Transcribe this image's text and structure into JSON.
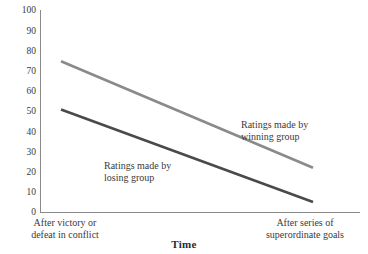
{
  "chart_data": {
    "type": "line",
    "title": "",
    "xlabel": "Time",
    "ylabel": "",
    "ylim": [
      0,
      100
    ],
    "grid": false,
    "legend_position": "inline-annotation",
    "categories": [
      "After victory or defeat in conflict",
      "After series of superordinate goals"
    ],
    "x": [
      0,
      1
    ],
    "yticks": [
      "0",
      "10",
      "20",
      "30",
      "40",
      "50",
      "60",
      "70",
      "80",
      "90",
      "100"
    ],
    "series": [
      {
        "name": "Ratings made by winning group",
        "values": [
          75,
          22
        ],
        "color": "#8a8a8a"
      },
      {
        "name": "Ratings made by losing group",
        "values": [
          51,
          5
        ],
        "color": "#4a4a4a"
      }
    ],
    "annotations": [
      {
        "text_line1": "Ratings made by",
        "text_line2": "winning group"
      },
      {
        "text_line1": "Ratings made by",
        "text_line2": "losing group"
      }
    ]
  },
  "axis": {
    "x_title": "Time",
    "x_cat_left_line1": "After victory or",
    "x_cat_left_line2": "defeat in conflict",
    "x_cat_right_line1": "After series of",
    "x_cat_right_line2": "superordinate goals",
    "ytick_100": "100",
    "ytick_90": "90",
    "ytick_80": "80",
    "ytick_70": "70",
    "ytick_60": "60",
    "ytick_50": "50",
    "ytick_40": "40",
    "ytick_30": "30",
    "ytick_20": "20",
    "ytick_10": "10",
    "ytick_0": "0"
  },
  "labels": {
    "winning_line1": "Ratings made by",
    "winning_line2": "winning group",
    "losing_line1": "Ratings made by",
    "losing_line2": "losing group"
  },
  "colors": {
    "winning_line": "#8a8a8a",
    "losing_line": "#4a4a4a",
    "axis": "#8a8a8a",
    "text": "#3a3a3a",
    "background": "#ffffff"
  }
}
